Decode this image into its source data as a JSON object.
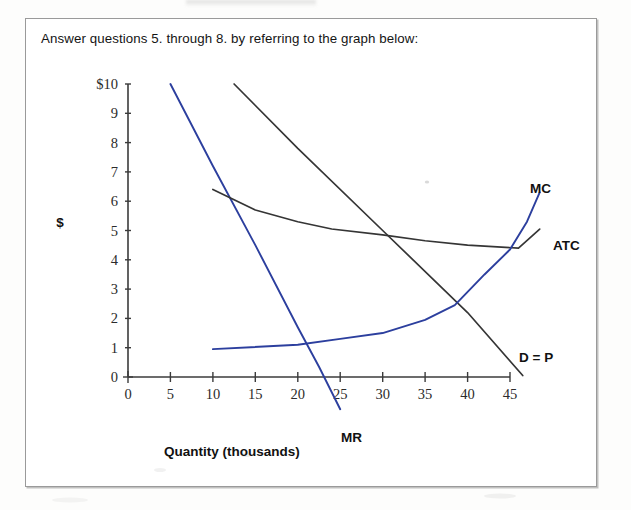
{
  "page": {
    "prompt": "Answer questions 5. through 8. by referring to the graph below:"
  },
  "chart_data": {
    "type": "line",
    "title": "",
    "xlabel": "Quantity (thousands)",
    "ylabel": "$",
    "xlim": [
      0,
      48
    ],
    "ylim": [
      0,
      10
    ],
    "xticks": [
      "0",
      "5",
      "10",
      "15",
      "20",
      "25",
      "30",
      "35",
      "40",
      "45"
    ],
    "xtick_values": [
      0,
      5,
      10,
      15,
      20,
      25,
      30,
      35,
      40,
      45
    ],
    "yticks": [
      "0",
      "1",
      "2",
      "3",
      "4",
      "5",
      "6",
      "7",
      "8",
      "9",
      "$10"
    ],
    "ytick_values": [
      0,
      1,
      2,
      3,
      4,
      5,
      6,
      7,
      8,
      9,
      10
    ],
    "grid": false,
    "legend": "inline-labels",
    "series": [
      {
        "name": "MR",
        "label": "MR",
        "color": "#2c3f9e",
        "points": [
          [
            5,
            10
          ],
          [
            10,
            7.2
          ],
          [
            15,
            4.5
          ],
          [
            20,
            1.7
          ],
          [
            22.5,
            0.35
          ],
          [
            25,
            -1.1
          ]
        ]
      },
      {
        "name": "D = P",
        "label": "D = P",
        "color": "#353535",
        "points": [
          [
            12.5,
            10
          ],
          [
            20,
            7.8
          ],
          [
            30,
            5.0
          ],
          [
            40,
            2.2
          ],
          [
            46.5,
            0.05
          ]
        ]
      },
      {
        "name": "ATC",
        "label": "ATC",
        "color": "#353535",
        "points": [
          [
            10,
            6.4
          ],
          [
            15,
            5.7
          ],
          [
            20,
            5.3
          ],
          [
            24,
            5.05
          ],
          [
            30,
            4.85
          ],
          [
            35,
            4.65
          ],
          [
            40,
            4.5
          ],
          [
            46,
            4.4
          ],
          [
            48.5,
            5.05
          ]
        ]
      },
      {
        "name": "MC",
        "label": "MC",
        "color": "#2c3f9e",
        "points": [
          [
            10,
            0.95
          ],
          [
            20,
            1.1
          ],
          [
            25,
            1.3
          ],
          [
            30,
            1.5
          ],
          [
            35,
            1.95
          ],
          [
            38.5,
            2.45
          ],
          [
            42,
            3.5
          ],
          [
            45,
            4.35
          ],
          [
            47,
            5.3
          ],
          [
            48.5,
            6.3
          ]
        ]
      }
    ]
  }
}
